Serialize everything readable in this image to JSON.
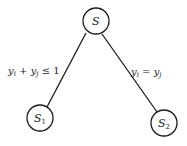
{
  "diagram": {
    "type": "tree",
    "nodes": [
      {
        "id": "S",
        "label": "S",
        "subscript": ""
      },
      {
        "id": "S1",
        "label": "S",
        "subscript": "1"
      },
      {
        "id": "S2",
        "label": "S",
        "subscript": "2"
      }
    ],
    "edges": [
      {
        "from": "S",
        "to": "S1",
        "label": "y_i + y_j ≤ 1",
        "label_parts": {
          "a": "y",
          "a_sub": "i",
          "op1": " + ",
          "b": "y",
          "b_sub": "j",
          "op2": " ≤ 1"
        }
      },
      {
        "from": "S",
        "to": "S2",
        "label": "y_i = y_j",
        "label_parts": {
          "a": "y",
          "a_sub": "i",
          "op1": " = ",
          "b": "y",
          "b_sub": "j"
        }
      }
    ]
  }
}
